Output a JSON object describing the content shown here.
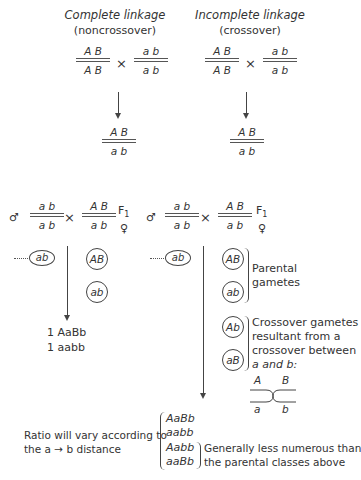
{
  "top": {
    "left": {
      "title": "Complete linkage",
      "subtitle": "(noncrossover)",
      "parent1": {
        "num": "A B",
        "den": "A B"
      },
      "parent2": {
        "num": "a b",
        "den": "a b"
      },
      "cross_symbol": "×",
      "offspring": {
        "num": "A B",
        "den": "a b"
      }
    },
    "right": {
      "title": "Incomplete linkage",
      "subtitle": "(crossover)",
      "parent1": {
        "num": "A B",
        "den": "A B"
      },
      "parent2": {
        "num": "a b",
        "den": "a b"
      },
      "cross_symbol": "×",
      "offspring": {
        "num": "A B",
        "den": "a b"
      }
    }
  },
  "testcross": {
    "male_symbol": "♂",
    "female_symbol": "♀",
    "f1_label": "F",
    "f1_sub": "1",
    "cross_symbol": "×",
    "left": {
      "male": {
        "num": "a b",
        "den": "a b"
      },
      "female": {
        "num": "A B",
        "den": "a b"
      },
      "male_gamete": "ab",
      "female_gametes": [
        "AB",
        "ab"
      ],
      "results": [
        "1 AaBb",
        "1 aabb"
      ]
    },
    "right": {
      "male": {
        "num": "a b",
        "den": "a b"
      },
      "female": {
        "num": "A B",
        "den": "a b"
      },
      "male_gamete": "ab",
      "parental_gametes": [
        "AB",
        "ab"
      ],
      "parental_label_1": "Parental",
      "parental_label_2": "gametes",
      "crossover_gametes": [
        "Ab",
        "aB"
      ],
      "crossover_label": [
        "Crossover gametes",
        "resultant from a",
        "crossover between",
        "a and b:"
      ],
      "chiasma": {
        "top_left": "A",
        "top_right": "B",
        "bottom_left": "a",
        "bottom_right": "b"
      }
    }
  },
  "footer": {
    "ratio_line1": "Ratio will vary according to",
    "ratio_line2": "the a → b distance",
    "genotypes": [
      "AaBb",
      "aabb",
      "Aabb",
      "aaBb"
    ],
    "note_line1": "Generally less numerous than",
    "note_line2": "the parental classes above"
  }
}
